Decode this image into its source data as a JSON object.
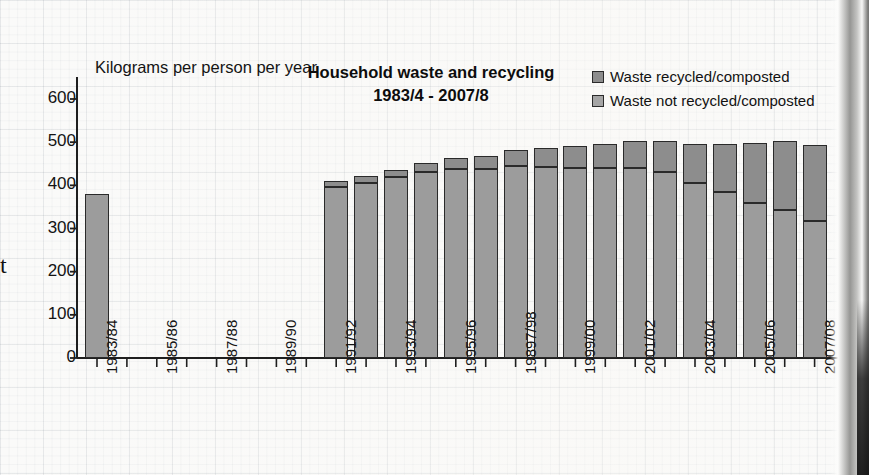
{
  "chart_data": {
    "type": "bar",
    "stacked": true,
    "title": "Household waste and recycling",
    "subtitle": "1983/4 - 2007/8",
    "axis_caption": "Kilograms per person per year",
    "xlabel": "",
    "ylabel": "Kilograms per person per year",
    "ylim": [
      0,
      600
    ],
    "yticks": [
      0,
      100,
      200,
      300,
      400,
      500,
      600
    ],
    "ytick_labels": [
      "0",
      "100",
      "200",
      "300",
      "400",
      "500",
      "600"
    ],
    "grid": true,
    "legend_position": "top-right",
    "series": [
      {
        "name": "Waste recycled/composted",
        "color": "#8d8d8d",
        "values": [
          0,
          null,
          null,
          null,
          null,
          null,
          null,
          null,
          15,
          17,
          15,
          20,
          25,
          30,
          38,
          45,
          50,
          55,
          62,
          70,
          90,
          110,
          140,
          160,
          175
        ]
      },
      {
        "name": "Waste not recycled/composted",
        "color": "#9c9c9c",
        "values": [
          380,
          null,
          null,
          null,
          null,
          null,
          null,
          null,
          395,
          405,
          420,
          432,
          438,
          438,
          445,
          442,
          440,
          440,
          440,
          432,
          405,
          385,
          358,
          342,
          318
        ]
      }
    ],
    "categories": [
      "1983/84",
      "1984/85",
      "1985/86",
      "1986/87",
      "1987/88",
      "1988/89",
      "1989/90",
      "1990/91",
      "1991/92",
      "1992/93",
      "1993/94",
      "1994/95",
      "1995/96",
      "1996/97",
      "19897/98",
      "1998/99",
      "1999/00",
      "2000/01",
      "2001/02",
      "2002/03",
      "2003/04",
      "2004/05",
      "2005/06",
      "2006/07",
      "2007/08"
    ],
    "visible_tick_labels": [
      "1983/84",
      "1985/86",
      "1987/88",
      "1989/90",
      "1991/92",
      "1993/94",
      "1995/96",
      "19897/98",
      "1999/00",
      "2001/02",
      "2003/04",
      "2005/06",
      "2007/08"
    ],
    "totals": [
      380,
      null,
      null,
      null,
      null,
      null,
      null,
      null,
      410,
      422,
      435,
      452,
      463,
      468,
      483,
      487,
      490,
      495,
      502,
      502,
      495,
      495,
      498,
      502,
      493
    ]
  },
  "legend": {
    "items": [
      {
        "label": "Waste recycled/composted",
        "color": "#8d8d8d"
      },
      {
        "label": "Waste not recycled/composted",
        "color": "#a5a5a5"
      }
    ]
  },
  "page": {
    "left_crop_mark": "t"
  }
}
